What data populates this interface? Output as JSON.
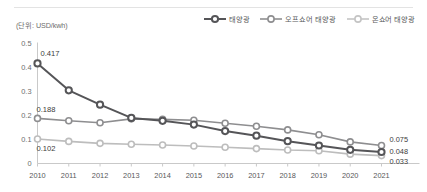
{
  "unit_note": "(단위: USD/kwh)",
  "legend": {
    "items": [
      {
        "label": "태양광",
        "color": "#555558",
        "icon": "line-marker-icon"
      },
      {
        "label": "오프쇼어 태양광",
        "color": "#8e8e90",
        "icon": "line-marker-icon"
      },
      {
        "label": "온쇼어 태양광",
        "color": "#bdbdbd",
        "icon": "line-marker-icon"
      }
    ]
  },
  "colors": {
    "solar": "#555558",
    "offshore": "#8e8e90",
    "onshore": "#bdbdbd",
    "axis": "#c9c9c9",
    "divider": "#e3e3e3",
    "text": "#6d6d6d"
  },
  "chart_data": {
    "type": "line",
    "title": "",
    "subtitle": "",
    "xlabel": "",
    "ylabel": "",
    "unit": "USD/kwh",
    "ylim": [
      0,
      0.5
    ],
    "yticks": [
      "0",
      "0.1",
      "0.2",
      "0.3",
      "0.4",
      "0.5"
    ],
    "ytick_values": [
      0,
      0.1,
      0.2,
      0.3,
      0.4,
      0.5
    ],
    "grid": false,
    "legend_position": "top-right",
    "categories": [
      "2010",
      "2011",
      "2012",
      "2013",
      "2014",
      "2015",
      "2016",
      "2017",
      "2018",
      "2019",
      "2020",
      "2021"
    ],
    "series": [
      {
        "name": "태양광",
        "color": "#555558",
        "values": [
          0.417,
          0.305,
          0.245,
          0.19,
          0.178,
          0.162,
          0.135,
          0.116,
          0.093,
          0.075,
          0.057,
          0.048
        ],
        "start_label": "0.417",
        "end_label": "0.048"
      },
      {
        "name": "오프쇼어 태양광",
        "color": "#8e8e90",
        "values": [
          0.188,
          0.178,
          0.17,
          0.186,
          0.184,
          0.18,
          0.168,
          0.155,
          0.14,
          0.12,
          0.09,
          0.075
        ],
        "start_label": "0.188",
        "end_label": "0.075"
      },
      {
        "name": "온쇼어 태양광",
        "color": "#bdbdbd",
        "values": [
          0.102,
          0.092,
          0.084,
          0.08,
          0.077,
          0.073,
          0.068,
          0.062,
          0.056,
          0.053,
          0.039,
          0.033
        ],
        "start_label": "0.102",
        "end_label": "0.033"
      }
    ],
    "annotations": [
      {
        "text": "0.417",
        "series": "태양광",
        "x": "2010"
      },
      {
        "text": "0.188",
        "series": "오프쇼어 태양광",
        "x": "2010"
      },
      {
        "text": "0.102",
        "series": "온쇼어 태양광",
        "x": "2010"
      },
      {
        "text": "0.075",
        "series": "오프쇼어 태양광",
        "x": "2021"
      },
      {
        "text": "0.048",
        "series": "태양광",
        "x": "2021"
      },
      {
        "text": "0.033",
        "series": "온쇼어 태양광",
        "x": "2021"
      }
    ]
  }
}
